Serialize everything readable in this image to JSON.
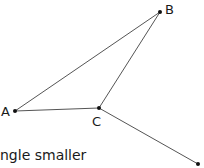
{
  "diagram": {
    "points": {
      "A": {
        "label": "A",
        "x": 15,
        "y": 111
      },
      "B": {
        "label": "B",
        "x": 160,
        "y": 12
      },
      "C": {
        "label": "C",
        "x": 99,
        "y": 108
      },
      "D": {
        "label": "",
        "x": 198,
        "y": 164
      }
    },
    "segments": [
      [
        "A",
        "B"
      ],
      [
        "A",
        "C"
      ],
      [
        "B",
        "C"
      ],
      [
        "C",
        "D"
      ]
    ],
    "line_color": "#555555",
    "point_color": "#111111"
  },
  "caption": "ngle smaller"
}
